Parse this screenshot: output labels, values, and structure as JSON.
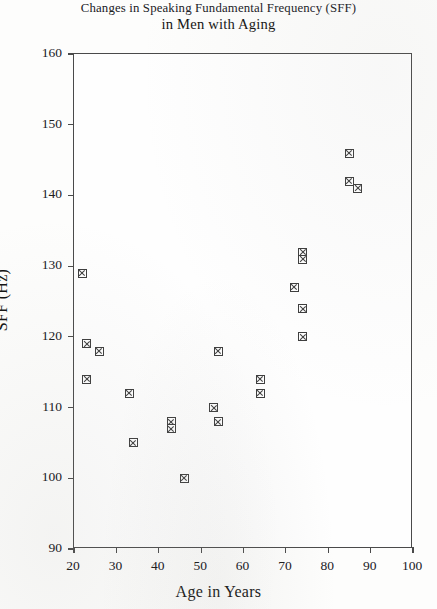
{
  "chart_data": {
    "type": "scatter",
    "title": "Changes in Speaking Fundamental Frequency (SFF) in Men with Aging",
    "title_line1": "Changes in Speaking Fundamental Frequency (SFF)",
    "title_line2": "in Men with Aging",
    "xlabel": "Age in Years",
    "ylabel": "SFF (Hz)",
    "xlim": [
      20,
      100
    ],
    "ylim": [
      90,
      160
    ],
    "xticks": [
      20,
      30,
      40,
      50,
      60,
      70,
      80,
      90,
      100
    ],
    "yticks": [
      90,
      100,
      110,
      120,
      130,
      140,
      150,
      160
    ],
    "grid": false,
    "legend": false,
    "marker": "square-with-x",
    "marker_color": "#3d3d3d",
    "x": [
      22,
      23,
      23,
      26,
      33,
      34,
      43,
      43,
      46,
      53,
      54,
      54,
      64,
      64,
      72,
      74,
      74,
      74,
      74,
      85,
      85,
      87
    ],
    "y": [
      129,
      119,
      114,
      118,
      112,
      105,
      108,
      107,
      100,
      110,
      118,
      108,
      114,
      112,
      127,
      132,
      131,
      124,
      120,
      146,
      142,
      141
    ],
    "points": [
      {
        "age": 22,
        "sff": 129
      },
      {
        "age": 23,
        "sff": 119
      },
      {
        "age": 23,
        "sff": 114
      },
      {
        "age": 26,
        "sff": 118
      },
      {
        "age": 33,
        "sff": 112
      },
      {
        "age": 34,
        "sff": 105
      },
      {
        "age": 43,
        "sff": 108
      },
      {
        "age": 43,
        "sff": 107
      },
      {
        "age": 46,
        "sff": 100
      },
      {
        "age": 53,
        "sff": 110
      },
      {
        "age": 54,
        "sff": 118
      },
      {
        "age": 54,
        "sff": 108
      },
      {
        "age": 64,
        "sff": 114
      },
      {
        "age": 64,
        "sff": 112
      },
      {
        "age": 72,
        "sff": 127
      },
      {
        "age": 74,
        "sff": 132
      },
      {
        "age": 74,
        "sff": 131
      },
      {
        "age": 74,
        "sff": 124
      },
      {
        "age": 74,
        "sff": 120
      },
      {
        "age": 85,
        "sff": 146
      },
      {
        "age": 85,
        "sff": 142
      },
      {
        "age": 87,
        "sff": 141
      }
    ]
  }
}
